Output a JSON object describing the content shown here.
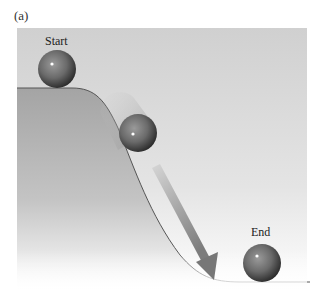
{
  "figure": {
    "panel_label": "(a)",
    "labels": {
      "start": "Start",
      "end": "End"
    },
    "elements": {
      "balls": [
        {
          "name": "start-ball",
          "state": "at rest on plateau"
        },
        {
          "name": "middle-ball",
          "state": "rolling down slope with motion blur"
        },
        {
          "name": "end-ball",
          "state": "at rest at bottom"
        }
      ],
      "arrow": "direction of motion down the slope",
      "hill": "plateau curving down to flat floor"
    },
    "colors": {
      "background_panel": "#d8d8d8",
      "hill_fill": "#a9a9a9",
      "ball": "#6e6e6e",
      "arrow": "#8a8a8a",
      "outline": "#555555"
    }
  }
}
